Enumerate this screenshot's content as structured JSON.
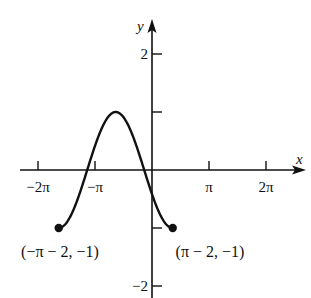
{
  "figure": {
    "ink_color": "#111111",
    "background": "#ffffff",
    "axes": {
      "x_label": "x",
      "y_label": "y",
      "x_ticks": [
        {
          "value": -6.2832,
          "label": "−2π"
        },
        {
          "value": -3.1416,
          "label": "−π"
        },
        {
          "value": 3.1416,
          "label": "π"
        },
        {
          "value": 6.2832,
          "label": "2π"
        }
      ],
      "y_ticks": [
        {
          "value": 2,
          "label": "2"
        },
        {
          "value": 1,
          "label": ""
        },
        {
          "value": -1,
          "label": ""
        },
        {
          "value": -2,
          "label": "−2"
        }
      ]
    },
    "curve": {
      "function": "y = cos(x + 2)",
      "domain": [
        -5.1416,
        1.1416
      ],
      "endpoints": [
        {
          "x": -5.1416,
          "y": -1,
          "label": "(−π − 2, −1)",
          "filled": true
        },
        {
          "x": 1.1416,
          "y": -1,
          "label": "(π − 2, −1)",
          "filled": true
        }
      ],
      "maximum": {
        "x": -2,
        "y": 1
      }
    }
  }
}
